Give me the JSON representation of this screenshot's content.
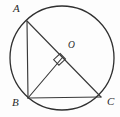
{
  "figure": {
    "background_color": "#fdfdfd",
    "stroke_color": "#3a3a3a",
    "label_color": "#2a2a2a",
    "width": 120,
    "height": 117
  },
  "circle": {
    "name": "circumscribed-circle",
    "center_x": 62,
    "center_y": 58,
    "radius": 52,
    "stroke_color": "#2f2f2f"
  },
  "points": [
    {
      "id": "A",
      "label": "A",
      "x": 27,
      "y": 21,
      "label_x": 13,
      "label_y": 3
    },
    {
      "id": "B",
      "label": "B",
      "x": 28,
      "y": 98,
      "label_x": 12,
      "label_y": 97
    },
    {
      "id": "C",
      "label": "C",
      "x": 101,
      "y": 97,
      "label_x": 107,
      "label_y": 96
    },
    {
      "id": "O",
      "label": "O",
      "x": 62,
      "y": 58,
      "label_x": 68,
      "label_y": 41
    }
  ],
  "segments": [
    {
      "id": "AB",
      "name": "segment-ab",
      "from": "A",
      "to": "B",
      "x1": 27,
      "y1": 21,
      "x2": 28,
      "y2": 98
    },
    {
      "id": "BC",
      "name": "segment-bc",
      "from": "B",
      "to": "C",
      "x1": 28,
      "y1": 98,
      "x2": 101,
      "y2": 97
    },
    {
      "id": "AC",
      "name": "segment-ac",
      "from": "A",
      "to": "C",
      "x1": 27,
      "y1": 21,
      "x2": 101,
      "y2": 97
    },
    {
      "id": "BO",
      "name": "segment-bo",
      "from": "B",
      "to": "O",
      "x1": 28,
      "y1": 98,
      "x2": 62,
      "y2": 58
    }
  ],
  "right_angle_marker": {
    "name": "right-angle-marker-at-o",
    "at_point": "O",
    "path": "M 53.6 59.7 L 58.9 65.2 L 65.5 59.1 L 60.2 53.6 Z",
    "size": 9
  }
}
